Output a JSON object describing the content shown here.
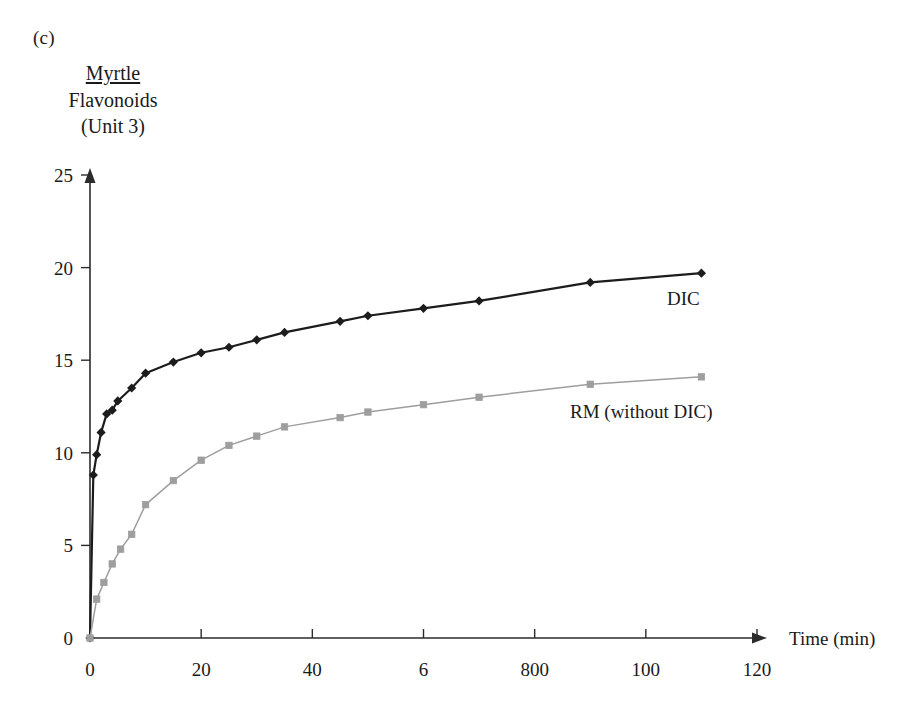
{
  "panel": {
    "letter": "(c)"
  },
  "title": {
    "line1": "Myrtle",
    "line2": "Flavonoids",
    "line3": "(Unit 3)"
  },
  "axes": {
    "x_caption": "Time (min)",
    "x_tick_labels": [
      "0",
      "20",
      "40",
      "6",
      "800",
      "100",
      "120"
    ],
    "y_tick_labels": [
      "0",
      "5",
      "10",
      "15",
      "20",
      "25"
    ]
  },
  "series_labels": {
    "dic": "DIC",
    "rm": "RM (without DIC)"
  },
  "colors": {
    "dic": "#1c1c1c",
    "rm": "#9e9e9e",
    "axis": "#2b2b2b",
    "background": "#ffffff"
  },
  "chart_data": {
    "type": "line",
    "title": "Myrtle Flavonoids (Unit 3)",
    "xlabel": "Time (min)",
    "ylabel": "Flavonoids (Unit 3)",
    "xlim": [
      0,
      120
    ],
    "ylim": [
      0,
      25
    ],
    "grid": false,
    "legend": "inline-annotations",
    "x_ticks": [
      0,
      20,
      40,
      60,
      80,
      100,
      120
    ],
    "x_tick_labels": [
      "0",
      "20",
      "40",
      "6",
      "800",
      "100",
      "120"
    ],
    "y_ticks": [
      0,
      5,
      10,
      15,
      20,
      25
    ],
    "series": [
      {
        "name": "DIC",
        "marker": "diamond",
        "color": "#1c1c1c",
        "x": [
          0,
          0.6,
          1.2,
          2,
          3,
          4,
          5,
          7.5,
          10,
          15,
          20,
          25,
          30,
          35,
          45,
          50,
          60,
          70,
          90,
          110
        ],
        "values": [
          0,
          8.8,
          9.9,
          11.1,
          12.1,
          12.3,
          12.8,
          13.5,
          14.3,
          14.9,
          15.4,
          15.7,
          16.1,
          16.5,
          17.1,
          17.4,
          17.8,
          18.2,
          19.2,
          19.7
        ]
      },
      {
        "name": "RM (without DIC)",
        "marker": "square",
        "color": "#9e9e9e",
        "x": [
          0,
          1.2,
          2.5,
          4,
          5.5,
          7.5,
          10,
          15,
          20,
          25,
          30,
          35,
          45,
          50,
          60,
          70,
          90,
          110
        ],
        "values": [
          0,
          2.1,
          3.0,
          4.0,
          4.8,
          5.6,
          7.2,
          8.5,
          9.6,
          10.4,
          10.9,
          11.4,
          11.9,
          12.2,
          12.6,
          13.0,
          13.7,
          14.1
        ]
      }
    ]
  }
}
